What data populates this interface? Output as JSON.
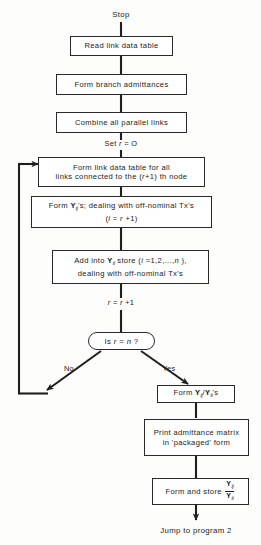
{
  "diagram": {
    "type": "flowchart",
    "terminal_start": "Stop",
    "terminal_end": "Jump to program 2",
    "nodes": [
      {
        "id": "n1",
        "shape": "process",
        "text": "Read link data table"
      },
      {
        "id": "n2",
        "shape": "process",
        "text": "Form branch admittances"
      },
      {
        "id": "n3",
        "shape": "process",
        "text": "Combine all parallel links"
      },
      {
        "id": "n4",
        "shape": "process",
        "line1": "Form link data table for all",
        "line2_a": "links connected to the (",
        "line2_r": "r",
        "line2_b": "+1) th node"
      },
      {
        "id": "n5",
        "shape": "process",
        "line1_a": "Form ",
        "line1_sym": "Y",
        "line1_sub": "ij",
        "line1_b": "'s; dealing with off-nominal Tx's",
        "line2_a": "(",
        "line2_i": "i",
        "line2_b": " = ",
        "line2_r": "r",
        "line2_c": " +1)"
      },
      {
        "id": "n6",
        "shape": "process",
        "line1_a": "Add into ",
        "line1_sym": "Y",
        "line1_sub": "ii",
        "line1_b": " store (",
        "line1_i": "i",
        "line1_c": " =1,2,...,",
        "line1_n": "n",
        "line1_d": " ),",
        "line2": "dealing with off-nominal Tx's"
      },
      {
        "id": "n7",
        "shape": "decision",
        "text_a": "Is ",
        "text_r": "r",
        "text_b": " = ",
        "text_n": "n",
        "text_c": " ?"
      },
      {
        "id": "n8",
        "shape": "process",
        "text_a": "Form ",
        "sym1": "Y",
        "sub1": "ij",
        "slash": "/",
        "sym2": "Y",
        "sub2": "ii",
        "text_b": "'s"
      },
      {
        "id": "n9",
        "shape": "process",
        "line1": "Print admittance matrix",
        "line2": "in 'packaged' form"
      },
      {
        "id": "n10",
        "shape": "process",
        "text_a": "Form and store ",
        "num_sym": "Y",
        "num_sub": "ij",
        "den_sym": "Y",
        "den_sub": "ii"
      }
    ],
    "edge_labels": [
      {
        "id": "set_r",
        "text_a": "Set ",
        "text_r": "r",
        "text_b": " = O"
      },
      {
        "id": "incr_r",
        "text_r1": "r",
        "text_eq": " = ",
        "text_r2": "r",
        "text_plus": " +1"
      },
      {
        "id": "branch_no",
        "text": "No"
      },
      {
        "id": "branch_yes",
        "text": "Yes"
      }
    ],
    "colors": {
      "stroke": "#1f1f1f",
      "box_border": "#2a2a2a",
      "text": "#1a1a1a",
      "background": "#fdfdfb"
    }
  }
}
